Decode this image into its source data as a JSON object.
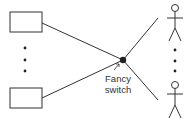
{
  "diagram": {
    "switch_label_line1": "Fancy",
    "switch_label_line2": "switch",
    "colors": {
      "stroke": "#333333",
      "switch_node": "#222222",
      "background": "#ffffff"
    },
    "nodes": {
      "boxes": [
        "top-box",
        "bottom-box"
      ],
      "people": [
        "top-person",
        "bottom-person"
      ],
      "ellipsis_left": "vertical-dots",
      "ellipsis_right": "vertical-dots"
    }
  }
}
